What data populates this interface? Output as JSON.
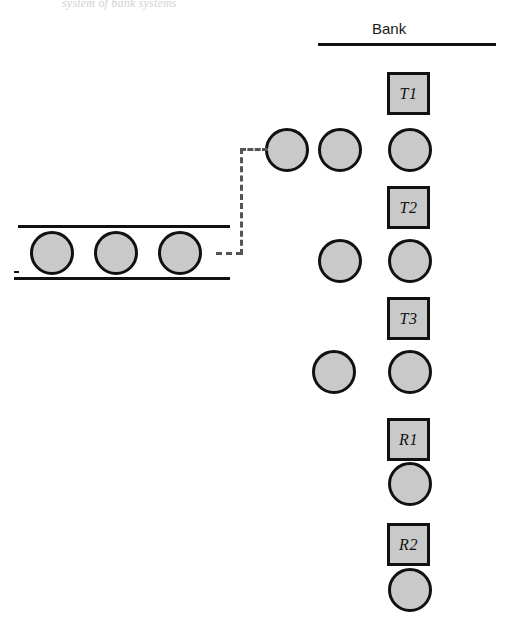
{
  "figure": {
    "caption_fragment": "system of bank systems",
    "bank_header": "Bank"
  },
  "bank_column": {
    "stations": [
      {
        "label": "T1",
        "x": 387,
        "y": 72
      },
      {
        "label": "T2",
        "x": 387,
        "y": 186
      },
      {
        "label": "T3",
        "x": 387,
        "y": 297
      },
      {
        "label": "R1",
        "x": 387,
        "y": 418
      },
      {
        "label": "R2",
        "x": 387,
        "y": 523
      }
    ],
    "queue_discs": [
      {
        "x": 388,
        "y": 128
      },
      {
        "x": 388,
        "y": 239
      },
      {
        "x": 388,
        "y": 350
      },
      {
        "x": 388,
        "y": 462
      },
      {
        "x": 388,
        "y": 568
      }
    ]
  },
  "waiting_discs": [
    {
      "x": 265,
      "y": 128
    },
    {
      "x": 318,
      "y": 128
    },
    {
      "x": 318,
      "y": 239
    },
    {
      "x": 312,
      "y": 350
    }
  ],
  "conveyor": {
    "discs": [
      {
        "x": 30,
        "y": 231
      },
      {
        "x": 94,
        "y": 231
      },
      {
        "x": 158,
        "y": 231
      }
    ]
  },
  "connector": {
    "segments": [
      {
        "orientation": "horizontal",
        "x": 216,
        "y": 252,
        "length": 26
      },
      {
        "orientation": "vertical",
        "x": 240,
        "y": 148,
        "length": 107
      },
      {
        "orientation": "horizontal",
        "x": 240,
        "y": 148,
        "length": 28
      }
    ]
  },
  "colors": {
    "shape_fill": "#c9c9c9",
    "shape_stroke": "#111111",
    "dashed_stroke": "#555555",
    "background": "#ffffff"
  }
}
